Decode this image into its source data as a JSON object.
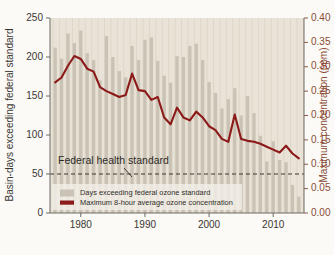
{
  "chart_data": {
    "type": "bar",
    "title": "",
    "subtitle": "",
    "xlabel": "",
    "ylabel": "Basin-days exceeding federal standard",
    "ylabel_right": "Maximum concentration (ppm)",
    "ylim": [
      0,
      250
    ],
    "ylim_right": [
      0.0,
      0.4
    ],
    "xlim": [
      1975.2,
      2014.8
    ],
    "grid": false,
    "legend_position": "bottom-left",
    "x": [
      1976,
      1977,
      1978,
      1979,
      1980,
      1981,
      1982,
      1983,
      1984,
      1985,
      1986,
      1987,
      1988,
      1989,
      1990,
      1991,
      1992,
      1993,
      1994,
      1995,
      1996,
      1997,
      1998,
      1999,
      2000,
      2001,
      2002,
      2003,
      2004,
      2005,
      2006,
      2007,
      2008,
      2009,
      2010,
      2011,
      2012,
      2013,
      2014
    ],
    "series": [
      {
        "name": "Days exceeding federal ozone standard",
        "type": "bar",
        "axis": "left",
        "color": "#c9c2b5",
        "unit": "basin-days",
        "values": [
          212,
          198,
          230,
          218,
          234,
          205,
          196,
          170,
          227,
          200,
          182,
          174,
          214,
          196,
          222,
          225,
          195,
          176,
          167,
          201,
          200,
          214,
          217,
          196,
          168,
          154,
          134,
          146,
          160,
          125,
          150,
          128,
          99,
          66,
          92,
          68,
          65,
          36,
          21
        ]
      },
      {
        "name": "Maximum 8-hour average ozone concentration",
        "type": "line",
        "axis": "right",
        "color": "#8c1a18",
        "unit": "ppm",
        "values": [
          0.268,
          0.278,
          0.302,
          0.322,
          0.316,
          0.296,
          0.29,
          0.258,
          0.25,
          0.244,
          0.238,
          0.242,
          0.286,
          0.252,
          0.25,
          0.232,
          0.238,
          0.196,
          0.182,
          0.216,
          0.196,
          0.19,
          0.208,
          0.196,
          0.178,
          0.17,
          0.152,
          0.146,
          0.202,
          0.152,
          0.148,
          0.146,
          0.142,
          0.136,
          0.13,
          0.124,
          0.138,
          0.122,
          0.112
        ]
      }
    ],
    "reference_line": {
      "label": "Federal health standard",
      "value": 0.08,
      "axis": "right",
      "style": "dashed"
    },
    "yticks": [
      0,
      50,
      100,
      150,
      200,
      250
    ],
    "ytick_labels": [
      "0",
      "50",
      "100",
      "150",
      "200",
      "250"
    ],
    "yticks_right": [
      0.0,
      0.05,
      0.1,
      0.15,
      0.2,
      0.25,
      0.3,
      0.35,
      0.4
    ],
    "ytick_labels_right": [
      "0.00",
      "0.05",
      "0.10",
      "0.15",
      "0.20",
      "0.25",
      "0.30",
      "0.35",
      "0.40"
    ],
    "xticks": [
      1980,
      1990,
      2000,
      2010
    ],
    "xtick_labels": [
      "1980",
      "1990",
      "2000",
      "2010"
    ],
    "legend": [
      {
        "label": "Days exceeding federal ozone standard",
        "marker": "bar",
        "color": "#c9c2b5"
      },
      {
        "label": "Maximum 8-hour average ozone concentration",
        "marker": "line",
        "color": "#8c1a18"
      }
    ],
    "colors": {
      "bar": "#c9c2b5",
      "line": "#8c1a18",
      "plot_background": "#e9e3d7",
      "page_background": "#fbfaf7",
      "right_axis_text": "#8a4a35",
      "left_axis_text": "#3a3631"
    }
  }
}
